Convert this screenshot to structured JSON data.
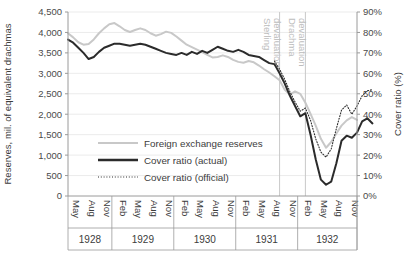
{
  "chart_data": {
    "type": "line",
    "title": "",
    "xlabel": "",
    "ylabel": "Reserves, mil. of equivalent drachmas",
    "y2label": "Cover ratio (%)",
    "ylim": [
      0,
      4500
    ],
    "y2lim": [
      0,
      90
    ],
    "yticks": [
      "0",
      "500",
      "1,000",
      "1,500",
      "2,000",
      "2,500",
      "3,000",
      "3,500",
      "4,000",
      "4,500"
    ],
    "ytick_values": [
      0,
      500,
      1000,
      1500,
      2000,
      2500,
      3000,
      3500,
      4000,
      4500
    ],
    "y2ticks": [
      "0%",
      "10%",
      "20%",
      "30%",
      "40%",
      "50%",
      "60%",
      "70%",
      "80%",
      "90%"
    ],
    "y2tick_values": [
      0,
      10,
      20,
      30,
      40,
      50,
      60,
      70,
      80,
      90
    ],
    "grid": true,
    "legend_position": "inside-left",
    "x_start_index": 0,
    "x_labels": [
      "May",
      "Aug",
      "Nov",
      "Feb",
      "May",
      "Aug",
      "Nov",
      "Feb",
      "May",
      "Aug",
      "Nov",
      "Feb",
      "May",
      "Aug",
      "Nov",
      "Feb",
      "May",
      "Aug",
      "Nov"
    ],
    "x_label_indices": [
      1,
      4,
      7,
      10,
      13,
      16,
      19,
      22,
      25,
      28,
      31,
      34,
      37,
      40,
      43,
      46,
      49,
      52,
      55
    ],
    "x_points": 57,
    "year_groups": [
      {
        "label": "1928",
        "start_index": 0,
        "end_index": 8
      },
      {
        "label": "1929",
        "start_index": 9,
        "end_index": 20
      },
      {
        "label": "1930",
        "start_index": 21,
        "end_index": 32
      },
      {
        "label": "1931",
        "start_index": 33,
        "end_index": 44
      },
      {
        "label": "1932",
        "start_index": 45,
        "end_index": 56
      }
    ],
    "annotations": [
      {
        "label": "Sterling devaluation",
        "index": 41,
        "color": "#c9c9c9"
      },
      {
        "label": "Drachma devaluation",
        "index": 46,
        "color": "#c9c9c9"
      }
    ],
    "series": [
      {
        "name": "Foreign exchange reserves",
        "axis": "left",
        "color": "#c8c8c8",
        "width": 2.0,
        "dash": "none",
        "values": [
          3980,
          3880,
          3760,
          3700,
          3720,
          3830,
          3980,
          4100,
          4200,
          4230,
          4150,
          4060,
          4010,
          4060,
          4100,
          4060,
          3980,
          3920,
          3960,
          4020,
          3990,
          3900,
          3800,
          3700,
          3640,
          3580,
          3520,
          3450,
          3390,
          3400,
          3440,
          3400,
          3330,
          3280,
          3260,
          3300,
          3270,
          3190,
          3100,
          3020,
          2930,
          2830,
          2600,
          2480,
          2560,
          2500,
          2280,
          2010,
          1720,
          1400,
          1180,
          1320,
          1530,
          1720,
          1850,
          1930,
          1860
        ]
      },
      {
        "name": "Cover ratio (actual)",
        "axis": "right",
        "color": "#2b2b2b",
        "width": 2.0,
        "dash": "none",
        "values": [
          76.5,
          75.0,
          72.5,
          70.0,
          67.0,
          68.0,
          70.5,
          72.5,
          73.5,
          74.5,
          74.5,
          74.0,
          73.5,
          74.0,
          74.5,
          74.0,
          73.0,
          72.0,
          71.0,
          70.0,
          69.5,
          69.0,
          70.0,
          69.0,
          70.5,
          69.5,
          71.0,
          70.0,
          71.5,
          73.0,
          72.0,
          71.0,
          70.5,
          71.5,
          70.5,
          69.0,
          68.5,
          68.0,
          66.5,
          65.0,
          64.5,
          60.0,
          55.0,
          49.0,
          44.0,
          39.0,
          40.5,
          30.0,
          18.0,
          8.0,
          5.5,
          7.0,
          16.0,
          27.0,
          29.5,
          28.5,
          31.0,
          36.5,
          38.0,
          35.5
        ]
      },
      {
        "name": "Cover ratio (official)",
        "axis": "right",
        "color": "#2b2b2b",
        "width": 1.1,
        "dash": "1,1.8",
        "values": [
          null,
          null,
          null,
          null,
          null,
          null,
          null,
          null,
          null,
          null,
          null,
          null,
          null,
          null,
          null,
          null,
          null,
          null,
          null,
          null,
          null,
          null,
          null,
          null,
          null,
          null,
          null,
          null,
          null,
          null,
          null,
          null,
          null,
          null,
          null,
          null,
          null,
          null,
          null,
          null,
          66.0,
          62.0,
          57.0,
          51.0,
          46.0,
          41.5,
          43.0,
          37.0,
          28.0,
          21.5,
          19.0,
          23.0,
          33.0,
          42.0,
          44.5,
          40.0,
          44.0,
          49.0,
          51.5,
          52.0
        ]
      }
    ],
    "legend": [
      {
        "label": "Foreign exchange reserves",
        "color": "#c8c8c8",
        "width": 2.0,
        "dash": "none"
      },
      {
        "label": "Cover ratio (actual)",
        "color": "#2b2b2b",
        "width": 2.4,
        "dash": "none"
      },
      {
        "label": "Cover ratio (official)",
        "color": "#2b2b2b",
        "width": 1.2,
        "dash": "1,1.8"
      }
    ]
  }
}
